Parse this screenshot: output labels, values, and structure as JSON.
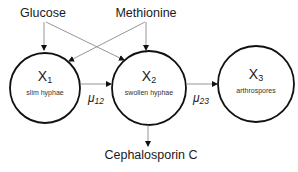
{
  "inputs": {
    "glucose": "Glucose",
    "methionine": "Methionine"
  },
  "states": [
    {
      "var": "X",
      "index": "1",
      "desc": "slim hyphae"
    },
    {
      "var": "X",
      "index": "2",
      "desc": "swollen hyphae"
    },
    {
      "var": "X",
      "index": "3",
      "desc": "arthrospores"
    }
  ],
  "rates": [
    {
      "symbol": "μ",
      "index": "12"
    },
    {
      "symbol": "μ",
      "index": "23"
    }
  ],
  "product": "Cephalosporin C",
  "colors": {
    "circle_stroke": "#111111",
    "arrow_stroke": "#8a8a8a",
    "arrow_head": "#111111",
    "text": "#1a1a1a"
  }
}
